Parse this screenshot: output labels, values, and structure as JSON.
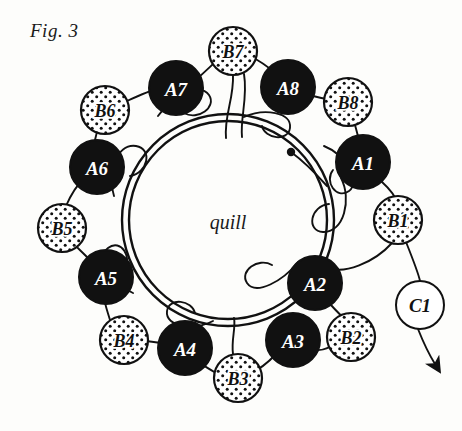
{
  "figure": {
    "caption": "Fig. 3",
    "center_label": "quill",
    "colors": {
      "ink": "#111111",
      "paper": "#fdfdfb",
      "bobbin_a_fill": "#111111",
      "bobbin_a_text": "#ffffff",
      "bobbin_b_fill": "#ffffff",
      "bobbin_b_text": "#111111",
      "bobbin_c_fill": "#ffffff",
      "bobbin_c_text": "#111111"
    },
    "quill_ring": {
      "cx": 228,
      "cy": 220,
      "outer_r": 106,
      "inner_r": 99
    },
    "thread_anchor_dot": {
      "cx": 291,
      "cy": 152,
      "r": 4
    },
    "arrow": {
      "label": "flow-arrow",
      "from_x": 420,
      "from_y": 329,
      "to_x": 437,
      "to_y": 368
    },
    "bobbins": [
      {
        "id": "A1",
        "label": "A1",
        "type": "A",
        "cx": 363,
        "cy": 162,
        "r": 27
      },
      {
        "id": "A2",
        "label": "A2",
        "type": "A",
        "cx": 315,
        "cy": 283,
        "r": 27
      },
      {
        "id": "A3",
        "label": "A3",
        "type": "A",
        "cx": 293,
        "cy": 340,
        "r": 27
      },
      {
        "id": "A4",
        "label": "A4",
        "type": "A",
        "cx": 185,
        "cy": 348,
        "r": 27
      },
      {
        "id": "A5",
        "label": "A5",
        "type": "A",
        "cx": 106,
        "cy": 277,
        "r": 27
      },
      {
        "id": "A6",
        "label": "A6",
        "type": "A",
        "cx": 97,
        "cy": 167,
        "r": 27
      },
      {
        "id": "A7",
        "label": "A7",
        "type": "A",
        "cx": 176,
        "cy": 88,
        "r": 27
      },
      {
        "id": "A8",
        "label": "A8",
        "type": "A",
        "cx": 288,
        "cy": 87,
        "r": 27
      },
      {
        "id": "B1",
        "label": "B1",
        "type": "B",
        "cx": 398,
        "cy": 220,
        "r": 24
      },
      {
        "id": "B2",
        "label": "B2",
        "type": "B",
        "cx": 351,
        "cy": 337,
        "r": 24
      },
      {
        "id": "B3",
        "label": "B3",
        "type": "B",
        "cx": 238,
        "cy": 378,
        "r": 24
      },
      {
        "id": "B4",
        "label": "B4",
        "type": "B",
        "cx": 124,
        "cy": 340,
        "r": 24
      },
      {
        "id": "B5",
        "label": "B5",
        "type": "B",
        "cx": 62,
        "cy": 228,
        "r": 24
      },
      {
        "id": "B6",
        "label": "B6",
        "type": "B",
        "cx": 105,
        "cy": 110,
        "r": 24
      },
      {
        "id": "B7",
        "label": "B7",
        "type": "B",
        "cx": 233,
        "cy": 51,
        "r": 24
      },
      {
        "id": "B8",
        "label": "B8",
        "type": "B",
        "cx": 348,
        "cy": 102,
        "r": 24
      },
      {
        "id": "C1",
        "label": "C1",
        "type": "C",
        "cx": 420,
        "cy": 305,
        "r": 24
      }
    ]
  }
}
